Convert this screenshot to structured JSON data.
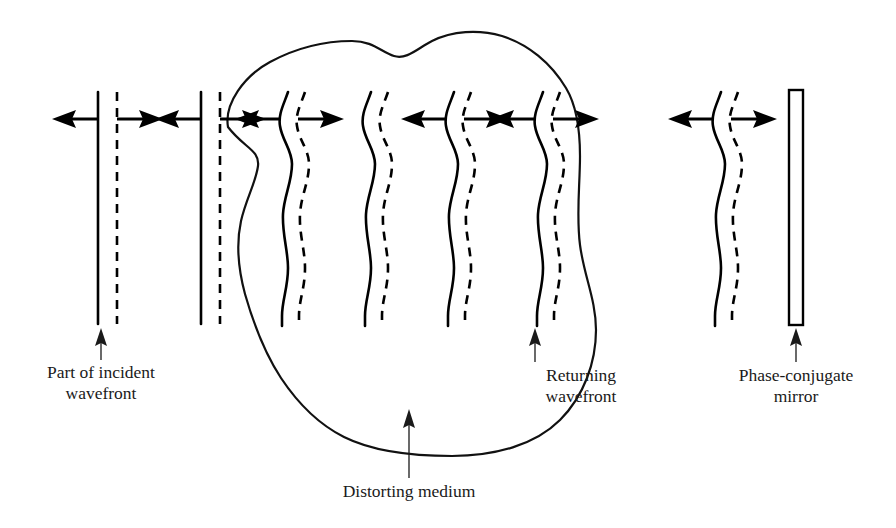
{
  "figure": {
    "background_color": "#ffffff",
    "ink_color": "#000000",
    "width": 896,
    "height": 528
  },
  "labels": {
    "incident": {
      "line1": "Part of incident",
      "line2": "wavefront"
    },
    "distorting": {
      "line1": "Distorting medium",
      "line2": ""
    },
    "returning": {
      "line1": "Returning",
      "line2": "wavefront"
    },
    "mirror": {
      "line1": "Phase-conjugate",
      "line2": "mirror"
    }
  },
  "wavefronts": [
    {
      "id": "wf-1",
      "kind": "planar",
      "x": 98,
      "label": "part-of-incident-wavefront"
    },
    {
      "id": "wf-2",
      "kind": "planar",
      "x": 201,
      "label": "incident-wavefront-2"
    },
    {
      "id": "wf-3",
      "kind": "distorted",
      "x": 290,
      "label": "distorted-wavefront-1"
    },
    {
      "id": "wf-4",
      "kind": "distorted",
      "x": 373,
      "label": "distorted-wavefront-2"
    },
    {
      "id": "wf-5",
      "kind": "distorted",
      "x": 456,
      "label": "distorted-wavefront-3"
    },
    {
      "id": "wf-6",
      "kind": "distorted",
      "x": 545,
      "label": "returning-wavefront"
    },
    {
      "id": "wf-7",
      "kind": "distorted",
      "x": 723,
      "label": "conjugated-wavefront"
    }
  ],
  "arrows": {
    "row_y": 119,
    "direction_note": "each wavefront pair shows a left-pointing and a right-pointing propagation arrow"
  },
  "mirror": {
    "x": 789,
    "width": 14,
    "top": 90,
    "bottom": 325,
    "hatch_pattern": "cross-hatch"
  },
  "medium": {
    "name": "Distorting medium",
    "outline_style": "irregular closed blob"
  }
}
